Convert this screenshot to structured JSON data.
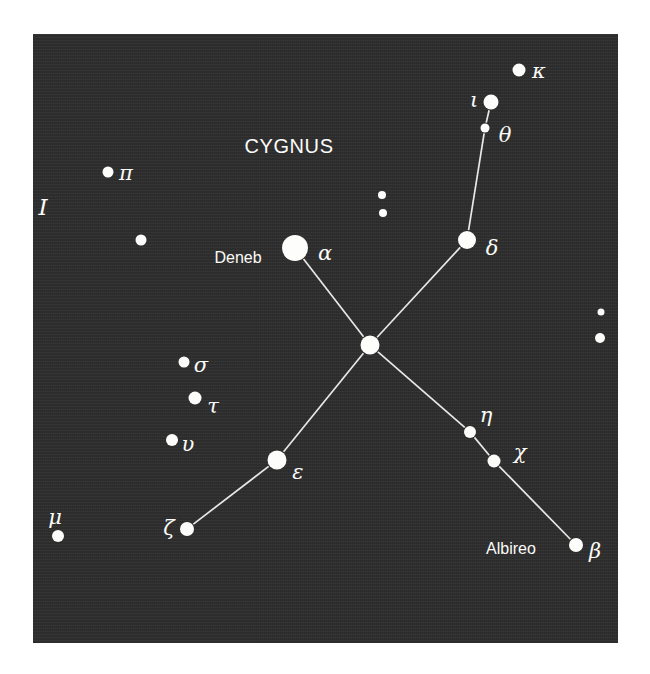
{
  "figure": {
    "title": "CYGNUS",
    "plate_index": "I",
    "background_color": "#2e2e2e",
    "star_color": "#fdfdfb",
    "line_color": "#e8e8e6",
    "panel": {
      "x": 33,
      "y": 34,
      "width": 585,
      "height": 609
    }
  },
  "chart_data": {
    "type": "scatter",
    "title": "CYGNUS",
    "xlabel": "",
    "ylabel": "",
    "xlim": [
      0,
      585
    ],
    "ylim": [
      0,
      609
    ],
    "grid": false,
    "legend": false,
    "note": "Star chart of the constellation Cygnus; x/y are panel-relative pixel positions, r is plotted dot radius scaling with apparent brightness.",
    "stars": [
      {
        "id": "alpha",
        "greek": "α",
        "proper_name": "Deneb",
        "x": 262,
        "y": 214,
        "r": 13.0,
        "label_dx": 30,
        "label_dy": 5,
        "name_dx": -57,
        "name_dy": 10
      },
      {
        "id": "gamma",
        "greek": "",
        "proper_name": "",
        "x": 337,
        "y": 311,
        "r": 9.5,
        "label_dx": 0,
        "label_dy": 0,
        "name_dx": 0,
        "name_dy": 0
      },
      {
        "id": "delta",
        "greek": "δ",
        "proper_name": "",
        "x": 434,
        "y": 206,
        "r": 9.0,
        "label_dx": 25,
        "label_dy": 8,
        "name_dx": 0,
        "name_dy": 0
      },
      {
        "id": "epsilon",
        "greek": "ε",
        "proper_name": "",
        "x": 244,
        "y": 426,
        "r": 9.5,
        "label_dx": 21,
        "label_dy": 12,
        "name_dx": 0,
        "name_dy": 0
      },
      {
        "id": "beta",
        "greek": "β",
        "proper_name": "Albireo",
        "x": 543,
        "y": 511,
        "r": 7.0,
        "label_dx": 19,
        "label_dy": 6,
        "name_dx": -65,
        "name_dy": 4
      },
      {
        "id": "zeta",
        "greek": "ζ",
        "proper_name": "",
        "x": 154,
        "y": 495,
        "r": 7.0,
        "label_dx": -18,
        "label_dy": -1,
        "name_dx": 0,
        "name_dy": 0
      },
      {
        "id": "iota",
        "greek": "ι",
        "proper_name": "",
        "x": 458,
        "y": 68,
        "r": 7.5,
        "label_dx": -17,
        "label_dy": -2,
        "name_dx": 0,
        "name_dy": 0
      },
      {
        "id": "kappa",
        "greek": "κ",
        "proper_name": "",
        "x": 486,
        "y": 36,
        "r": 6.5,
        "label_dx": 20,
        "label_dy": 1,
        "name_dx": 0,
        "name_dy": 0
      },
      {
        "id": "theta",
        "greek": "θ",
        "proper_name": "",
        "x": 452,
        "y": 94,
        "r": 4.5,
        "label_dx": 20,
        "label_dy": 7,
        "name_dx": 0,
        "name_dy": 0
      },
      {
        "id": "eta",
        "greek": "η",
        "proper_name": "",
        "x": 437,
        "y": 398,
        "r": 6.0,
        "label_dx": 16,
        "label_dy": -17,
        "name_dx": 0,
        "name_dy": 0
      },
      {
        "id": "chi",
        "greek": "χ",
        "proper_name": "",
        "x": 461,
        "y": 427,
        "r": 6.5,
        "label_dx": 26,
        "label_dy": -9,
        "name_dx": 0,
        "name_dy": 0
      },
      {
        "id": "pi",
        "greek": "π",
        "proper_name": "",
        "x": 75,
        "y": 138,
        "r": 5.5,
        "label_dx": 18,
        "label_dy": 1,
        "name_dx": 0,
        "name_dy": 0
      },
      {
        "id": "sigma",
        "greek": "σ",
        "proper_name": "",
        "x": 151,
        "y": 328,
        "r": 5.5,
        "label_dx": 17,
        "label_dy": 3,
        "name_dx": 0,
        "name_dy": 0
      },
      {
        "id": "tau",
        "greek": "τ",
        "proper_name": "",
        "x": 162,
        "y": 364,
        "r": 6.5,
        "label_dx": 18,
        "label_dy": 8,
        "name_dx": 0,
        "name_dy": 0
      },
      {
        "id": "upsilon",
        "greek": "υ",
        "proper_name": "",
        "x": 139,
        "y": 406,
        "r": 6.0,
        "label_dx": 16,
        "label_dy": 4,
        "name_dx": 0,
        "name_dy": 0
      },
      {
        "id": "mu",
        "greek": "μ",
        "proper_name": "",
        "x": 25,
        "y": 502,
        "r": 6.0,
        "label_dx": -3,
        "label_dy": -19,
        "name_dx": 0,
        "name_dy": 0
      },
      {
        "id": "field-1",
        "greek": "",
        "proper_name": "",
        "x": 108,
        "y": 206,
        "r": 5.5,
        "label_dx": 0,
        "label_dy": 0,
        "name_dx": 0,
        "name_dy": 0
      },
      {
        "id": "field-2",
        "greek": "",
        "proper_name": "",
        "x": 349,
        "y": 161,
        "r": 4.0,
        "label_dx": 0,
        "label_dy": 0,
        "name_dx": 0,
        "name_dy": 0
      },
      {
        "id": "field-3",
        "greek": "",
        "proper_name": "",
        "x": 350,
        "y": 179,
        "r": 4.0,
        "label_dx": 0,
        "label_dy": 0,
        "name_dx": 0,
        "name_dy": 0
      },
      {
        "id": "field-4",
        "greek": "",
        "proper_name": "",
        "x": 568,
        "y": 278,
        "r": 3.5,
        "label_dx": 0,
        "label_dy": 0,
        "name_dx": 0,
        "name_dy": 0
      },
      {
        "id": "field-5",
        "greek": "",
        "proper_name": "",
        "x": 567,
        "y": 304,
        "r": 5.0,
        "label_dx": 0,
        "label_dy": 0,
        "name_dx": 0,
        "name_dy": 0
      }
    ],
    "lines": [
      {
        "from": "alpha",
        "to": "gamma"
      },
      {
        "from": "gamma",
        "to": "delta"
      },
      {
        "from": "delta",
        "to": "theta"
      },
      {
        "from": "theta",
        "to": "iota"
      },
      {
        "from": "gamma",
        "to": "epsilon"
      },
      {
        "from": "epsilon",
        "to": "zeta"
      },
      {
        "from": "gamma",
        "to": "eta"
      },
      {
        "from": "eta",
        "to": "chi"
      },
      {
        "from": "chi",
        "to": "beta"
      }
    ],
    "text_labels": [
      {
        "id": "constellation-title",
        "text": "CYGNUS",
        "x": 256,
        "y": 112
      },
      {
        "id": "plate-index",
        "text": "I",
        "x": 10,
        "y": 173
      }
    ]
  }
}
